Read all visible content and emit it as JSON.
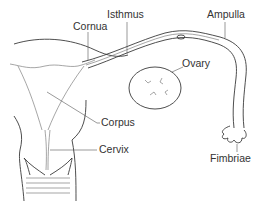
{
  "diagram": {
    "labels": [
      {
        "id": "cornua",
        "text": "Cornua"
      },
      {
        "id": "isthmus",
        "text": "Isthmus"
      },
      {
        "id": "ampulla",
        "text": "Ampulla"
      },
      {
        "id": "ovary",
        "text": "Ovary"
      },
      {
        "id": "corpus",
        "text": "Corpus"
      },
      {
        "id": "cervix",
        "text": "Cervix"
      },
      {
        "id": "fimbriae",
        "text": "Fimbriae"
      }
    ]
  }
}
